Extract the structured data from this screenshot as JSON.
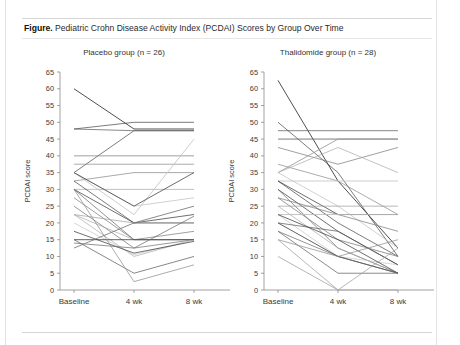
{
  "caption": {
    "lead": "Figure.",
    "text": " Pediatric Crohn Disease Activity Index (PCDAI) Scores by Group Over Time"
  },
  "chart_data": [
    {
      "type": "line",
      "title": "Placebo group (n = 26)",
      "xlabel": "",
      "ylabel": "PCDAI score",
      "categories": [
        "Baseline",
        "4 wk",
        "8 wk"
      ],
      "yticks": [
        0,
        5,
        10,
        15,
        20,
        25,
        30,
        35,
        40,
        45,
        50,
        55,
        60,
        65
      ],
      "ylim": [
        0,
        65
      ],
      "grid": false,
      "legend": "none",
      "n": 26,
      "series": [
        {
          "name": "p1",
          "values": [
            60.0,
            48.0,
            48.0
          ]
        },
        {
          "name": "p2",
          "values": [
            48.0,
            50.0,
            50.0
          ]
        },
        {
          "name": "p3",
          "values": [
            48.0,
            47.5,
            47.5
          ]
        },
        {
          "name": "p4",
          "values": [
            35.0,
            47.5,
            47.5
          ]
        },
        {
          "name": "p5",
          "values": [
            40.0,
            40.0,
            40.0
          ]
        },
        {
          "name": "p6",
          "values": [
            37.5,
            37.5,
            37.5
          ]
        },
        {
          "name": "p7",
          "values": [
            32.5,
            35.0,
            35.0
          ]
        },
        {
          "name": "p8",
          "values": [
            30.0,
            30.0,
            30.0
          ]
        },
        {
          "name": "p9",
          "values": [
            35.0,
            25.0,
            27.5
          ]
        },
        {
          "name": "p10",
          "values": [
            35.0,
            22.5,
            45.0
          ]
        },
        {
          "name": "p11",
          "values": [
            35.0,
            25.0,
            35.0
          ]
        },
        {
          "name": "p12",
          "values": [
            32.5,
            20.0,
            20.0
          ]
        },
        {
          "name": "p13",
          "values": [
            30.0,
            20.0,
            22.5
          ]
        },
        {
          "name": "p14",
          "values": [
            30.0,
            15.0,
            15.0
          ]
        },
        {
          "name": "p15",
          "values": [
            27.5,
            15.0,
            17.5
          ]
        },
        {
          "name": "p16",
          "values": [
            25.0,
            12.5,
            15.0
          ]
        },
        {
          "name": "p17",
          "values": [
            22.5,
            20.0,
            20.0
          ]
        },
        {
          "name": "p18",
          "values": [
            22.5,
            15.0,
            15.0
          ]
        },
        {
          "name": "p19",
          "values": [
            22.5,
            10.0,
            15.0
          ]
        },
        {
          "name": "p20",
          "values": [
            20.0,
            10.5,
            15.0
          ]
        },
        {
          "name": "p21",
          "values": [
            17.5,
            11.0,
            14.5
          ]
        },
        {
          "name": "p22",
          "values": [
            15.0,
            15.0,
            15.0
          ]
        },
        {
          "name": "p23",
          "values": [
            15.0,
            5.0,
            10.0
          ]
        },
        {
          "name": "p24",
          "values": [
            14.0,
            12.5,
            22.0
          ]
        },
        {
          "name": "p25",
          "values": [
            12.5,
            20.0,
            25.0
          ]
        },
        {
          "name": "p26",
          "values": [
            30.0,
            2.5,
            7.5
          ]
        }
      ]
    },
    {
      "type": "line",
      "title": "Thalidomide group (n = 28)",
      "xlabel": "",
      "ylabel": "PCDAI score",
      "categories": [
        "Baseline",
        "4 wk",
        "8 wk"
      ],
      "yticks": [
        0,
        5,
        10,
        15,
        20,
        25,
        30,
        35,
        40,
        45,
        50,
        55,
        60,
        65
      ],
      "ylim": [
        0,
        65
      ],
      "grid": false,
      "legend": "none",
      "n": 28,
      "series": [
        {
          "name": "t1",
          "values": [
            62.5,
            32.5,
            12.5
          ]
        },
        {
          "name": "t2",
          "values": [
            50.0,
            35.0,
            10.0
          ]
        },
        {
          "name": "t3",
          "values": [
            47.5,
            47.5,
            47.5
          ]
        },
        {
          "name": "t4",
          "values": [
            45.0,
            45.0,
            45.0
          ]
        },
        {
          "name": "t5",
          "values": [
            42.5,
            37.5,
            42.5
          ]
        },
        {
          "name": "t6",
          "values": [
            37.5,
            32.5,
            22.5
          ]
        },
        {
          "name": "t7",
          "values": [
            35.0,
            45.0,
            45.0
          ]
        },
        {
          "name": "t8",
          "values": [
            35.0,
            42.5,
            35.0
          ]
        },
        {
          "name": "t9",
          "values": [
            35.0,
            25.0,
            12.5
          ]
        },
        {
          "name": "t10",
          "values": [
            32.5,
            32.5,
            32.5
          ]
        },
        {
          "name": "t11",
          "values": [
            32.5,
            22.5,
            22.5
          ]
        },
        {
          "name": "t12",
          "values": [
            32.5,
            20.0,
            10.0
          ]
        },
        {
          "name": "t13",
          "values": [
            30.0,
            17.5,
            7.5
          ]
        },
        {
          "name": "t14",
          "values": [
            30.0,
            12.5,
            5.0
          ]
        },
        {
          "name": "t15",
          "values": [
            27.5,
            22.5,
            17.5
          ]
        },
        {
          "name": "t16",
          "values": [
            27.5,
            15.0,
            10.0
          ]
        },
        {
          "name": "t17",
          "values": [
            25.0,
            25.0,
            25.0
          ]
        },
        {
          "name": "t18",
          "values": [
            25.0,
            12.5,
            5.0
          ]
        },
        {
          "name": "t19",
          "values": [
            22.5,
            22.5,
            22.5
          ]
        },
        {
          "name": "t20",
          "values": [
            22.5,
            10.0,
            7.5
          ]
        },
        {
          "name": "t21",
          "values": [
            22.5,
            15.0,
            5.0
          ]
        },
        {
          "name": "t22",
          "values": [
            20.0,
            10.0,
            5.0
          ]
        },
        {
          "name": "t23",
          "values": [
            20.0,
            17.5,
            7.5
          ]
        },
        {
          "name": "t24",
          "values": [
            17.5,
            10.0,
            5.0
          ]
        },
        {
          "name": "t25",
          "values": [
            17.5,
            5.0,
            5.0
          ]
        },
        {
          "name": "t26",
          "values": [
            15.0,
            10.0,
            15.0
          ]
        },
        {
          "name": "t27",
          "values": [
            15.0,
            0.0,
            12.5
          ]
        },
        {
          "name": "t28",
          "values": [
            10.0,
            0.0,
            0.0
          ]
        }
      ]
    }
  ]
}
